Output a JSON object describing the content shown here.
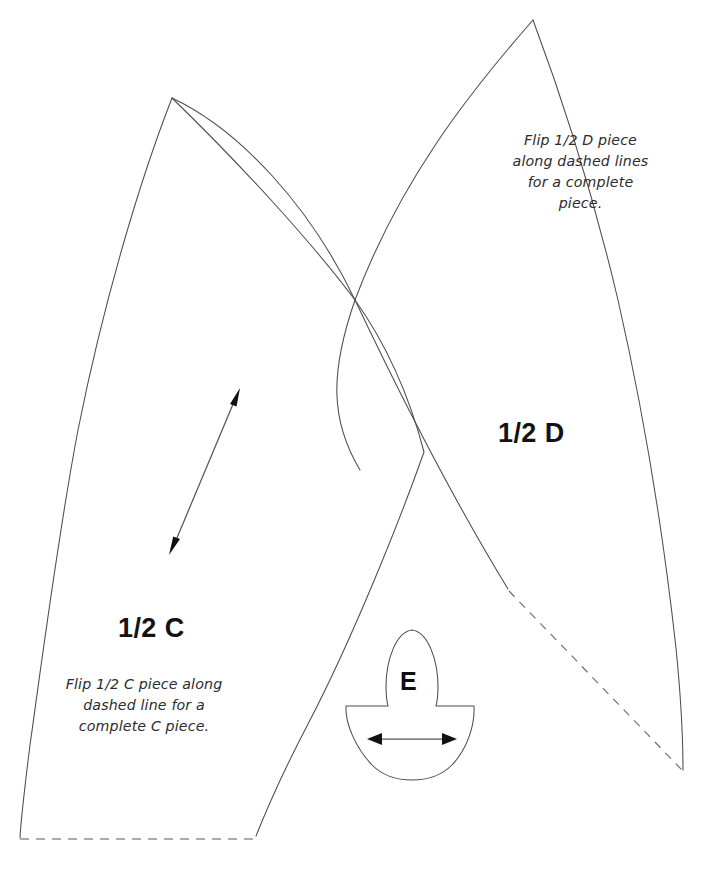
{
  "page": {
    "kind": "sewing-pattern-sheet",
    "background_color": "#ffffff",
    "line_color": "#4c4c52",
    "width": 715,
    "height": 870,
    "header_faint_text": "             "
  },
  "pieces": [
    {
      "id": "half-c",
      "label": "1/2 C",
      "note": "Flip 1/2 C piece along\ndashed line for a\ncomplete C piece.",
      "fold_edge": "bottom horizontal dashed line",
      "grain": "diagonal double-headed arrow"
    },
    {
      "id": "half-d",
      "label": "1/2 D",
      "note": "Flip 1/2 D piece\nalong dashed lines\nfor a complete\npiece.",
      "fold_edge": "lower-left diagonal dashed line"
    },
    {
      "id": "e",
      "label": "E",
      "note": "",
      "grain": "horizontal double-headed arrow"
    }
  ],
  "labels": {
    "c_id": "1/2 C",
    "d_id": "1/2 D",
    "e_id": "E",
    "c_note": "Flip 1/2 C piece along\ndashed line for a\ncomplete C piece.",
    "d_note": "Flip 1/2 D piece\nalong dashed lines\nfor a complete\npiece."
  },
  "geometry": {
    "c_apex": [
      172,
      98
    ],
    "c_bottom_left": [
      20,
      839
    ],
    "c_bottom_right": [
      255,
      838
    ],
    "d_apex": [
      533,
      20
    ],
    "d_bottom_right": [
      683,
      770
    ],
    "d_fold_start": [
      508,
      590
    ],
    "curve_crossing": [
      355,
      300
    ],
    "e_top_apex": [
      412,
      630
    ],
    "e_bowl_bottom": [
      412,
      779
    ],
    "grain_c_from": [
      170,
      552
    ],
    "grain_c_to": [
      240,
      389
    ],
    "grain_e_from": [
      368,
      739
    ],
    "grain_e_to": [
      456,
      739
    ]
  }
}
